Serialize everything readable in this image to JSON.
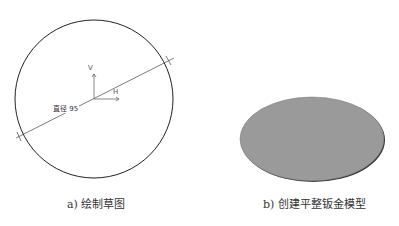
{
  "figure_a": {
    "caption": "a) 绘制草图",
    "dimension_label": "直径 95",
    "axis_v_label": "V",
    "axis_h_label": "H"
  },
  "figure_b": {
    "caption": "b) 创建平整钣金模型",
    "fill_color": "#9a9a9a",
    "edge_color": "#333333"
  }
}
